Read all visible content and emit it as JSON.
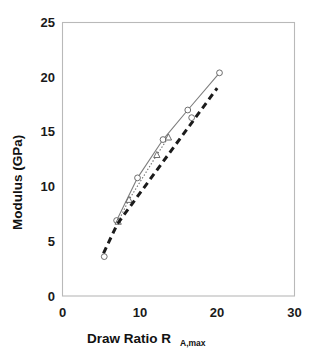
{
  "figure": {
    "background_color": "#ffffff",
    "frame_color": "#b9b9b9"
  },
  "chart_data": {
    "type": "line",
    "title": "",
    "xlabel": "Draw Ratio R",
    "xlabel_subscript": "A,max",
    "ylabel": "Modulus (GPa)",
    "xlim": [
      0,
      30
    ],
    "ylim": [
      0,
      25
    ],
    "xticks": [
      0,
      10,
      20,
      30
    ],
    "yticks": [
      0,
      5,
      10,
      15,
      20,
      25
    ],
    "xtick_labels": [
      "0",
      "10",
      "20",
      "30"
    ],
    "ytick_labels": [
      "0",
      "5",
      "10",
      "15",
      "20",
      "25"
    ],
    "grid": false,
    "legend": "none",
    "series": [
      {
        "name": "solid-open-circles",
        "style": "solid",
        "marker": "open-circle",
        "color": "#7d7d7d",
        "x": [
          7.0,
          9.7,
          13.0,
          16.2,
          20.3
        ],
        "y": [
          6.9,
          10.8,
          14.3,
          17.0,
          20.4
        ]
      },
      {
        "name": "dotted-open-triangles",
        "style": "dotted",
        "marker": "open-triangle",
        "color": "#6e6e6e",
        "x": [
          7.2,
          8.6,
          12.2,
          13.7
        ],
        "y": [
          6.8,
          8.8,
          12.9,
          14.5
        ]
      },
      {
        "name": "thick-dashed-trend",
        "style": "dashed",
        "marker": "none",
        "color": "#1b1b1b",
        "x": [
          5.3,
          7.1,
          20.0
        ],
        "y": [
          3.9,
          6.6,
          19.0
        ]
      },
      {
        "name": "small-open-circles-lower",
        "style": "none",
        "marker": "open-circle",
        "color": "#6e6e6e",
        "x": [
          5.4,
          16.7
        ],
        "y": [
          3.6,
          16.3
        ]
      }
    ]
  }
}
